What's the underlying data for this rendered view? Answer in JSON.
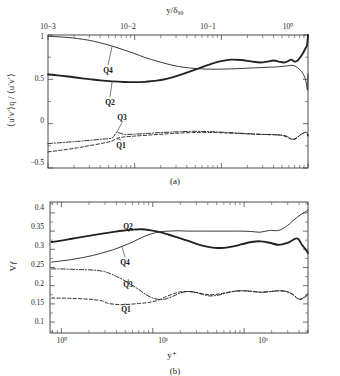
{
  "figure": {
    "name": "quadrant-analysis-figure",
    "background": "#ffffff",
    "ink_color": "#222222"
  },
  "chart_data": [
    {
      "id": "panel-a",
      "type": "line",
      "title": "",
      "caption": "(a)",
      "xlabel": "y/δ₉₉",
      "ylabel": "⟨u′v′⟩q / ⟨u′v′⟩",
      "xscale": "log",
      "xlim": [
        0.001,
        1.0
      ],
      "ylim": [
        -0.5,
        1.0
      ],
      "xaxis_position": "top",
      "xticks": [
        0.001,
        0.01,
        0.1,
        1.0
      ],
      "xticklabels": [
        "10−3",
        "10−2",
        "10−1",
        "10⁰"
      ],
      "yticks": [
        -0.5,
        0,
        0.5,
        1
      ],
      "yticklabels": [
        "−0.5",
        "0",
        "0.5",
        "1"
      ],
      "grid": false,
      "legend": "inline-annotations",
      "series": [
        {
          "name": "Q2",
          "style": "thick-solid",
          "label": "Q2",
          "x": [
            0.001,
            0.0013,
            0.0017,
            0.0022,
            0.003,
            0.004,
            0.0055,
            0.0075,
            0.01,
            0.013,
            0.018,
            0.024,
            0.032,
            0.043,
            0.058,
            0.078,
            0.1,
            0.13,
            0.17,
            0.22,
            0.28,
            0.34,
            0.4,
            0.46,
            0.52,
            0.58,
            0.64,
            0.7,
            0.76,
            0.82,
            0.88,
            0.93,
            0.96,
            0.98,
            1.0
          ],
          "y": [
            0.555,
            0.545,
            0.532,
            0.518,
            0.502,
            0.488,
            0.477,
            0.47,
            0.468,
            0.472,
            0.485,
            0.508,
            0.545,
            0.588,
            0.632,
            0.678,
            0.706,
            0.722,
            0.718,
            0.702,
            0.69,
            0.7,
            0.712,
            0.7,
            0.69,
            0.702,
            0.722,
            0.7,
            0.712,
            0.752,
            0.8,
            0.845,
            0.87,
            0.9,
            1.0
          ]
        },
        {
          "name": "Q4",
          "style": "thin-solid",
          "label": "Q4",
          "x": [
            0.001,
            0.0013,
            0.0017,
            0.0022,
            0.003,
            0.004,
            0.0055,
            0.0075,
            0.01,
            0.013,
            0.018,
            0.024,
            0.032,
            0.043,
            0.058,
            0.078,
            0.1,
            0.13,
            0.17,
            0.22,
            0.28,
            0.34,
            0.4,
            0.46,
            0.52,
            0.58,
            0.64,
            0.7,
            0.76,
            0.82,
            0.88,
            0.92,
            0.95,
            0.97,
            0.99,
            1.0
          ],
          "y": [
            0.985,
            0.98,
            0.972,
            0.96,
            0.94,
            0.912,
            0.875,
            0.832,
            0.79,
            0.748,
            0.706,
            0.672,
            0.645,
            0.628,
            0.618,
            0.615,
            0.615,
            0.618,
            0.622,
            0.628,
            0.632,
            0.636,
            0.638,
            0.642,
            0.648,
            0.652,
            0.658,
            0.652,
            0.63,
            0.6,
            0.56,
            0.52,
            0.47,
            0.42,
            0.385,
            0.56
          ]
        },
        {
          "name": "Q3",
          "style": "dash-dot",
          "label": "Q3",
          "x": [
            0.001,
            0.0015,
            0.0022,
            0.003,
            0.0042,
            0.0055,
            0.0062,
            0.0075,
            0.01,
            0.014,
            0.019,
            0.026,
            0.035,
            0.047,
            0.063,
            0.085,
            0.11,
            0.15,
            0.2,
            0.26,
            0.32,
            0.38,
            0.44,
            0.5,
            0.56,
            0.62,
            0.68,
            0.74,
            0.8,
            0.86,
            0.91,
            0.95,
            0.98,
            1.0
          ],
          "y": [
            -0.225,
            -0.212,
            -0.2,
            -0.188,
            -0.175,
            -0.16,
            -0.1,
            -0.12,
            -0.118,
            -0.11,
            -0.102,
            -0.095,
            -0.09,
            -0.086,
            -0.088,
            -0.092,
            -0.098,
            -0.105,
            -0.112,
            -0.118,
            -0.122,
            -0.124,
            -0.126,
            -0.13,
            -0.14,
            -0.162,
            -0.175,
            -0.16,
            -0.13,
            -0.112,
            -0.1,
            -0.095,
            -0.108,
            -0.135
          ]
        },
        {
          "name": "Q1",
          "style": "dashed",
          "label": "Q1",
          "x": [
            0.001,
            0.0015,
            0.0022,
            0.003,
            0.0042,
            0.0055,
            0.0062,
            0.0075,
            0.01,
            0.014,
            0.019,
            0.026,
            0.035,
            0.047,
            0.063,
            0.085,
            0.11,
            0.15,
            0.2,
            0.26,
            0.32,
            0.38,
            0.44,
            0.5,
            0.56,
            0.62,
            0.68,
            0.74,
            0.8,
            0.86,
            0.91,
            0.95,
            0.98,
            1.0
          ],
          "y": [
            -0.318,
            -0.296,
            -0.272,
            -0.248,
            -0.222,
            -0.195,
            -0.168,
            -0.15,
            -0.14,
            -0.13,
            -0.12,
            -0.112,
            -0.105,
            -0.1,
            -0.098,
            -0.1,
            -0.104,
            -0.11,
            -0.116,
            -0.12,
            -0.122,
            -0.124,
            -0.126,
            -0.132,
            -0.148,
            -0.17,
            -0.18,
            -0.165,
            -0.132,
            -0.115,
            -0.102,
            -0.096,
            -0.112,
            -0.14
          ]
        }
      ],
      "annotations": [
        {
          "text": "Q4",
          "x_px": 108,
          "y_px": 73
        },
        {
          "text": "Q2",
          "x_px": 110,
          "y_px": 105
        },
        {
          "text": "Q3",
          "x_px": 122,
          "y_px": 120
        },
        {
          "text": "Q1",
          "x_px": 121,
          "y_px": 148
        }
      ]
    },
    {
      "id": "panel-b",
      "type": "line",
      "title": "",
      "caption": "(b)",
      "xlabel": "y⁺",
      "ylabel": "Vƒ",
      "xscale": "log",
      "xlim": [
        0.75,
        500
      ],
      "ylim": [
        0.07,
        0.43
      ],
      "xaxis_position": "bottom",
      "xticks": [
        1,
        10,
        100
      ],
      "xticklabels": [
        "10⁰",
        "10¹",
        "10²"
      ],
      "yticks": [
        0.1,
        0.15,
        0.2,
        0.25,
        0.3,
        0.35,
        0.4
      ],
      "yticklabels": [
        "0.1",
        "0.15",
        "0.2",
        "0.25",
        "0.3",
        "0.35",
        "0.4"
      ],
      "grid": false,
      "legend": "inline-annotations",
      "series": [
        {
          "name": "Q2",
          "style": "thick-solid",
          "label": "Q2",
          "x": [
            0.78,
            1.0,
            1.3,
            1.7,
            2.2,
            2.8,
            3.6,
            4.6,
            6.0,
            7.5,
            9.5,
            12,
            15,
            19,
            24,
            30,
            38,
            48,
            60,
            76,
            95,
            120,
            150,
            190,
            240,
            300,
            380,
            430,
            470,
            500
          ],
          "y": [
            0.32,
            0.324,
            0.329,
            0.334,
            0.339,
            0.343,
            0.347,
            0.351,
            0.354,
            0.355,
            0.352,
            0.347,
            0.34,
            0.332,
            0.324,
            0.315,
            0.308,
            0.304,
            0.304,
            0.308,
            0.314,
            0.32,
            0.322,
            0.318,
            0.312,
            0.318,
            0.33,
            0.312,
            0.3,
            0.29
          ]
        },
        {
          "name": "Q4",
          "style": "thin-solid",
          "label": "Q4",
          "x": [
            0.78,
            1.0,
            1.3,
            1.7,
            2.2,
            2.8,
            3.6,
            4.6,
            6.0,
            7.5,
            9.5,
            12,
            15,
            19,
            24,
            30,
            38,
            48,
            60,
            76,
            95,
            120,
            150,
            190,
            240,
            300,
            340,
            380,
            420,
            460,
            500
          ],
          "y": [
            0.265,
            0.268,
            0.272,
            0.277,
            0.283,
            0.29,
            0.298,
            0.308,
            0.32,
            0.332,
            0.342,
            0.348,
            0.35,
            0.351,
            0.35,
            0.35,
            0.35,
            0.35,
            0.35,
            0.35,
            0.35,
            0.349,
            0.347,
            0.352,
            0.352,
            0.366,
            0.378,
            0.388,
            0.396,
            0.402,
            0.408
          ]
        },
        {
          "name": "Q3",
          "style": "dash-dot",
          "label": "Q3",
          "x": [
            0.78,
            1.0,
            1.3,
            1.7,
            2.2,
            2.8,
            3.2,
            3.8,
            4.6,
            5.6,
            7.0,
            8.5,
            10,
            12,
            14,
            17,
            20,
            24,
            29,
            35,
            42,
            52,
            64,
            80,
            100,
            125,
            155,
            195,
            240,
            290,
            340,
            400,
            460,
            500
          ],
          "y": [
            0.246,
            0.246,
            0.245,
            0.244,
            0.243,
            0.24,
            0.236,
            0.228,
            0.218,
            0.205,
            0.19,
            0.175,
            0.166,
            0.162,
            0.164,
            0.172,
            0.18,
            0.184,
            0.182,
            0.176,
            0.172,
            0.174,
            0.18,
            0.185,
            0.186,
            0.184,
            0.182,
            0.184,
            0.186,
            0.184,
            0.176,
            0.163,
            0.17,
            0.178
          ]
        },
        {
          "name": "Q1",
          "style": "dashed",
          "label": "Q1",
          "x": [
            0.78,
            1.0,
            1.3,
            1.7,
            2.2,
            2.8,
            3.2,
            3.8,
            4.6,
            5.6,
            7.0,
            8.5,
            10,
            12,
            14,
            17,
            20,
            24,
            29,
            35,
            42,
            52,
            64,
            80,
            100,
            125,
            155,
            195,
            240,
            290,
            340,
            400,
            460,
            500
          ],
          "y": [
            0.166,
            0.166,
            0.165,
            0.164,
            0.162,
            0.158,
            0.152,
            0.149,
            0.148,
            0.149,
            0.151,
            0.153,
            0.156,
            0.162,
            0.17,
            0.178,
            0.183,
            0.184,
            0.182,
            0.178,
            0.175,
            0.177,
            0.181,
            0.185,
            0.186,
            0.184,
            0.182,
            0.184,
            0.186,
            0.184,
            0.176,
            0.162,
            0.168,
            0.176
          ]
        }
      ],
      "annotations": [
        {
          "text": "Q2",
          "x_px": 128,
          "y_px": 229
        },
        {
          "text": "Q4",
          "x_px": 125,
          "y_px": 265
        },
        {
          "text": "Q3",
          "x_px": 128,
          "y_px": 287
        },
        {
          "text": "Q1",
          "x_px": 126,
          "y_px": 312
        }
      ]
    }
  ]
}
